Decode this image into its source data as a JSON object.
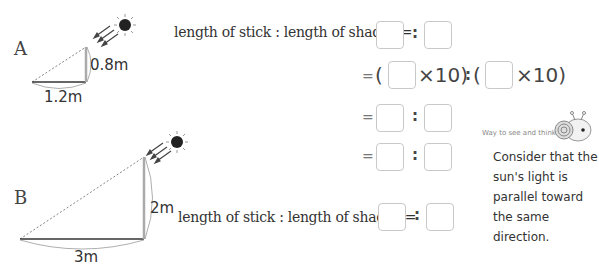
{
  "figure_a": {
    "label": "A",
    "stick_height": "0.8m",
    "shadow_length": "1.2m"
  },
  "figure_b": {
    "label": "B",
    "stick_height": "2m",
    "shadow_length": "3m"
  },
  "equations_a": {
    "ratio_label": "length of stick : length of shadow=",
    "equals": "=",
    "colon": ":",
    "open_paren": "(",
    "times_ten_close": "×10)",
    "rows": [
      {
        "type": "ratio"
      },
      {
        "type": "times_ten"
      },
      {
        "type": "ratio"
      },
      {
        "type": "ratio"
      }
    ]
  },
  "equations_b": {
    "ratio_label": "length of stick : length of shadow=",
    "colon": ":"
  },
  "tip": {
    "title": "Way to see and think",
    "lines": [
      "Consider that the",
      "sun's light is",
      "parallel toward",
      "the same",
      "direction."
    ]
  }
}
